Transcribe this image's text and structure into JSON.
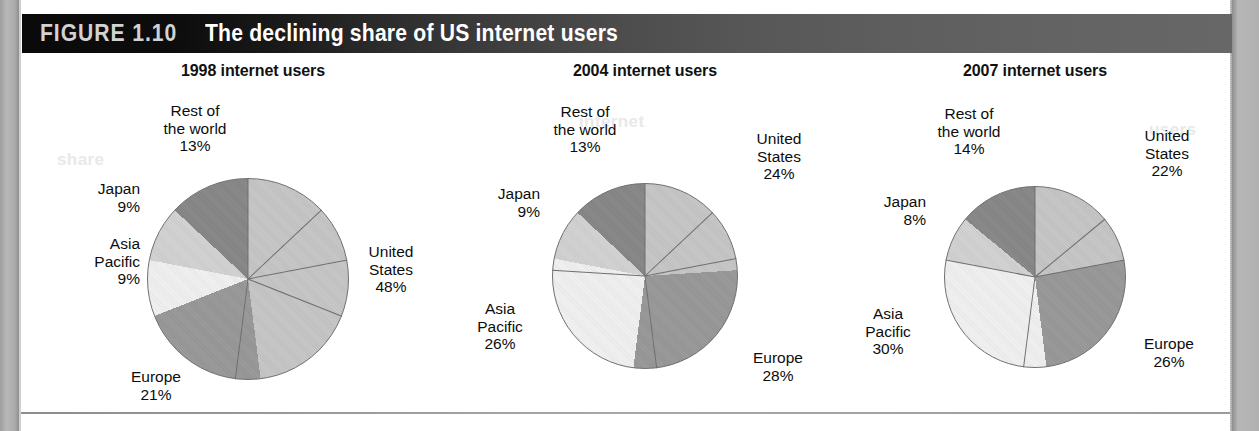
{
  "figure": {
    "number": "FIGURE 1.10",
    "caption": "The declining share of US internet users"
  },
  "palette": {
    "united_states": "#c6c6c6",
    "europe": "#989898",
    "asia_pacific": "#f1f1f1",
    "japan": "#d2d2d2",
    "rest_of_world": "#878787",
    "slice_outline": "#6f6f6f",
    "title_bar_dark": "#0a0a0a",
    "title_bar_light": "#676767",
    "text": "#0d0d0d"
  },
  "ghosts": {
    "g1": "internet",
    "g2": "Asia",
    "g3": "global",
    "g4": "users",
    "g5": "share"
  },
  "charts": [
    {
      "title": "1998 internet users",
      "labels": {
        "rest_of_world": "Rest of\nthe world\n13%",
        "japan": "Japan\n9%",
        "asia_pacific": "Asia\nPacific\n9%",
        "europe": "Europe\n21%",
        "united_states": "United\nStates\n48%"
      }
    },
    {
      "title": "2004 internet users",
      "labels": {
        "rest_of_world": "Rest of\nthe world\n13%",
        "japan": "Japan\n9%",
        "asia_pacific": "Asia\nPacific\n26%",
        "europe": "Europe\n28%",
        "united_states": "United\nStates\n24%"
      }
    },
    {
      "title": "2007 internet users",
      "labels": {
        "rest_of_world": "Rest of\nthe world\n14%",
        "japan": "Japan\n8%",
        "asia_pacific": "Asia\nPacific\n30%",
        "europe": "Europe\n26%",
        "united_states": "United\nStates\n22%"
      }
    }
  ],
  "chart_data": [
    {
      "type": "pie",
      "title": "1998 internet users",
      "categories": [
        "United States",
        "Europe",
        "Asia Pacific",
        "Japan",
        "Rest of the world"
      ],
      "values": [
        48,
        21,
        9,
        9,
        13
      ],
      "unit": "%",
      "start_angle_deg": 0,
      "direction": "clockwise",
      "colors": [
        "#c6c6c6",
        "#989898",
        "#f1f1f1",
        "#d2d2d2",
        "#878787"
      ],
      "legend": "labels-outside",
      "grid": false
    },
    {
      "type": "pie",
      "title": "2004 internet users",
      "categories": [
        "United States",
        "Europe",
        "Asia Pacific",
        "Japan",
        "Rest of the world"
      ],
      "values": [
        24,
        28,
        26,
        9,
        13
      ],
      "unit": "%",
      "start_angle_deg": 0,
      "direction": "clockwise",
      "colors": [
        "#c6c6c6",
        "#989898",
        "#f1f1f1",
        "#d2d2d2",
        "#878787"
      ],
      "legend": "labels-outside",
      "grid": false
    },
    {
      "type": "pie",
      "title": "2007 internet users",
      "categories": [
        "United States",
        "Europe",
        "Asia Pacific",
        "Japan",
        "Rest of the world"
      ],
      "values": [
        22,
        26,
        30,
        8,
        14
      ],
      "unit": "%",
      "start_angle_deg": 0,
      "direction": "clockwise",
      "colors": [
        "#c6c6c6",
        "#989898",
        "#f1f1f1",
        "#d2d2d2",
        "#878787"
      ],
      "legend": "labels-outside",
      "grid": false
    }
  ]
}
